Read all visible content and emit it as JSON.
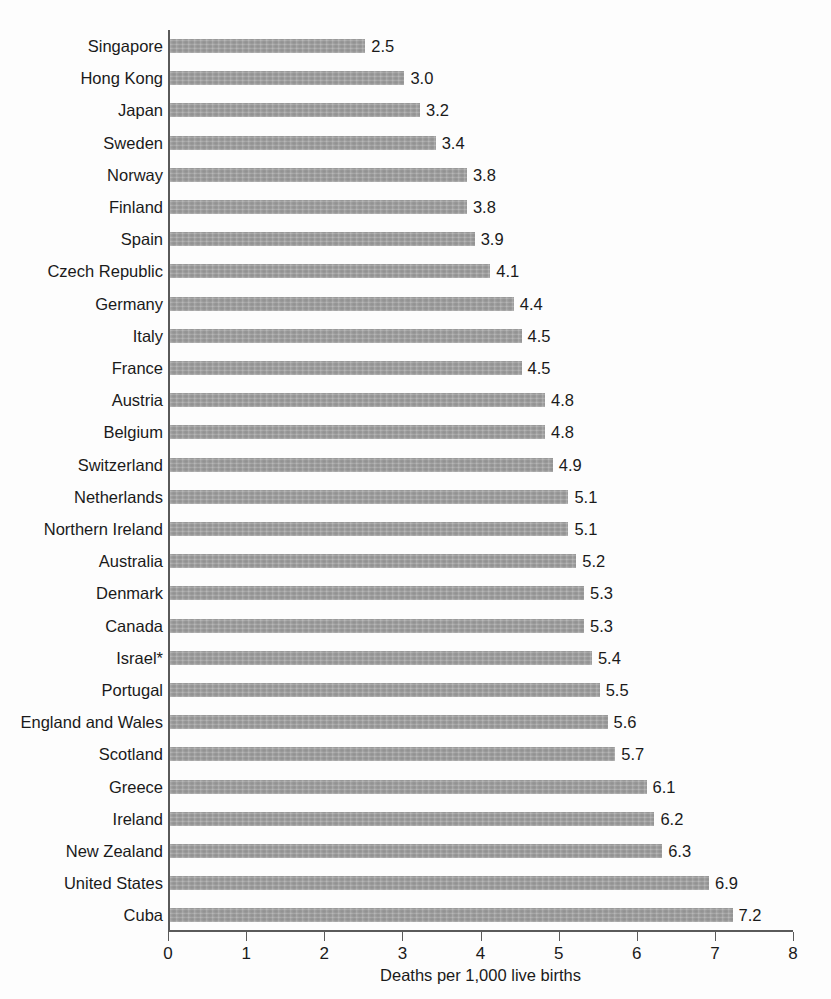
{
  "chart_data": {
    "type": "bar",
    "orientation": "horizontal",
    "title": "",
    "xlabel": "Deaths per 1,000 live births",
    "ylabel": "",
    "xlim": [
      0,
      8
    ],
    "xticks": [
      "0",
      "1",
      "2",
      "3",
      "4",
      "5",
      "6",
      "7",
      "8"
    ],
    "grid": false,
    "legend": "none",
    "bar_color": "#9d9d9d",
    "categories": [
      "Singapore",
      "Hong Kong",
      "Japan",
      "Sweden",
      "Norway",
      "Finland",
      "Spain",
      "Czech Republic",
      "Germany",
      "Italy",
      "France",
      "Austria",
      "Belgium",
      "Switzerland",
      "Netherlands",
      "Northern Ireland",
      "Australia",
      "Denmark",
      "Canada",
      "Israel*",
      "Portugal",
      "England and Wales",
      "Scotland",
      "Greece",
      "Ireland",
      "New Zealand",
      "United States",
      "Cuba"
    ],
    "values": [
      2.5,
      3.0,
      3.2,
      3.4,
      3.8,
      3.8,
      3.9,
      4.1,
      4.4,
      4.5,
      4.5,
      4.8,
      4.8,
      4.9,
      5.1,
      5.1,
      5.2,
      5.3,
      5.3,
      5.4,
      5.5,
      5.6,
      5.7,
      6.1,
      6.2,
      6.3,
      6.9,
      7.2
    ],
    "value_labels": [
      "2.5",
      "3.0",
      "3.2",
      "3.4",
      "3.8",
      "3.8",
      "3.9",
      "4.1",
      "4.4",
      "4.5",
      "4.5",
      "4.8",
      "4.8",
      "4.9",
      "5.1",
      "5.1",
      "5.2",
      "5.3",
      "5.3",
      "5.4",
      "5.5",
      "5.6",
      "5.7",
      "6.1",
      "6.2",
      "6.3",
      "6.9",
      "7.2"
    ]
  }
}
